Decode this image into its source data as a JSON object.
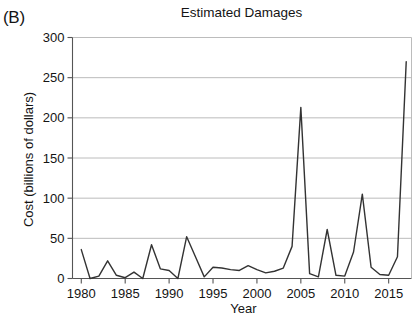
{
  "figure": {
    "panel_label": "(B)",
    "title": "Estimated Damages"
  },
  "axes": {
    "y_title": "Cost (billions of dollars)",
    "x_title": "Year"
  },
  "chart_data": {
    "type": "line",
    "title": "Estimated Damages",
    "xlabel": "Year",
    "ylabel": "Cost (billions of dollars)",
    "xlim": [
      1979,
      2017.6
    ],
    "ylim": [
      0,
      300
    ],
    "grid": true,
    "grid_axis": "y",
    "legend": "none",
    "line_color": "#333333",
    "line_width": 1.4,
    "markers": "none",
    "x_ticks": [
      1980,
      1985,
      1990,
      1995,
      2000,
      2005,
      2010,
      2015
    ],
    "x_tick_labels": [
      "1980",
      "1985",
      "1990",
      "1995",
      "2000",
      "2005",
      "2010",
      "2015"
    ],
    "y_ticks": [
      0,
      50,
      100,
      150,
      200,
      250,
      300
    ],
    "y_tick_labels": [
      "0",
      "50",
      "100",
      "150",
      "200",
      "250",
      "300"
    ],
    "x": [
      1980,
      1981,
      1982,
      1983,
      1984,
      1985,
      1986,
      1987,
      1988,
      1989,
      1990,
      1991,
      1992,
      1993,
      1994,
      1995,
      1996,
      1997,
      1998,
      1999,
      2000,
      2001,
      2002,
      2003,
      2004,
      2005,
      2006,
      2007,
      2008,
      2009,
      2010,
      2011,
      2012,
      2013,
      2014,
      2015,
      2016,
      2017
    ],
    "y": [
      36,
      0,
      3,
      22,
      4,
      1,
      8,
      0,
      42,
      12,
      10,
      0,
      52,
      27,
      2,
      14,
      13,
      11,
      10,
      16,
      11,
      7,
      9,
      13,
      40,
      213,
      6,
      2,
      61,
      4,
      3,
      33,
      105,
      14,
      5,
      4,
      27,
      270
    ],
    "series": [
      {
        "name": "Estimated Damages",
        "values": [
          36,
          0,
          3,
          22,
          4,
          1,
          8,
          0,
          42,
          12,
          10,
          0,
          52,
          27,
          2,
          14,
          13,
          11,
          10,
          16,
          11,
          7,
          9,
          13,
          40,
          213,
          6,
          2,
          61,
          4,
          3,
          33,
          105,
          14,
          5,
          4,
          27,
          270
        ]
      }
    ],
    "notable_points": [
      {
        "x": 1980,
        "y": 36
      },
      {
        "x": 1988,
        "y": 42
      },
      {
        "x": 1992,
        "y": 52
      },
      {
        "x": 2005,
        "y": 213
      },
      {
        "x": 2008,
        "y": 61
      },
      {
        "x": 2012,
        "y": 105
      },
      {
        "x": 2017,
        "y": 270
      }
    ]
  },
  "colors": {
    "line": "#333333",
    "grid": "#b4b4b4",
    "axis": "#555555",
    "text": "#141414",
    "background": "#ffffff"
  }
}
